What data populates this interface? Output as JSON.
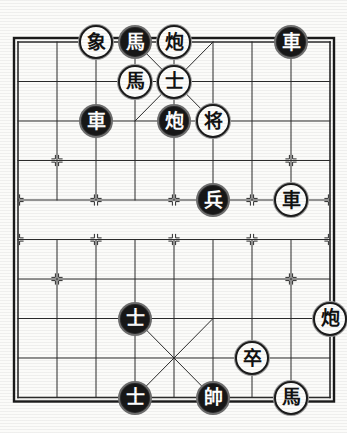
{
  "app": {
    "title": "Xiangqi Board Position",
    "kind": "chinese-chess-board"
  },
  "board": {
    "files": 9,
    "ranks": 10,
    "origin_x": 18,
    "origin_y": 42,
    "file_step": 39,
    "rank_step": 39.5,
    "river_extra": 0,
    "line_color": "#2b2b2b",
    "border_color": "#1a1a1a",
    "background_color": "#fbfbf9",
    "palace_top_ranks": [
      0,
      2
    ],
    "palace_bottom_ranks": [
      7,
      9
    ],
    "palace_files": [
      3,
      5
    ],
    "river_top_rank": 4,
    "river_bottom_rank": 5,
    "star_points": [
      {
        "file": 1,
        "rank": 3
      },
      {
        "file": 7,
        "rank": 3
      },
      {
        "file": 1,
        "rank": 6
      },
      {
        "file": 7,
        "rank": 6
      },
      {
        "file": 0,
        "rank": 4
      },
      {
        "file": 2,
        "rank": 4
      },
      {
        "file": 4,
        "rank": 4
      },
      {
        "file": 6,
        "rank": 4
      },
      {
        "file": 8,
        "rank": 4
      },
      {
        "file": 0,
        "rank": 5
      },
      {
        "file": 2,
        "rank": 5
      },
      {
        "file": 4,
        "rank": 5
      },
      {
        "file": 6,
        "rank": 5
      },
      {
        "file": 8,
        "rank": 5
      }
    ]
  },
  "pieces": [
    {
      "id": "p1",
      "glyph": "象",
      "name": "elephant",
      "style": "light",
      "file": 2,
      "rank": 0
    },
    {
      "id": "p2",
      "glyph": "馬",
      "name": "horse",
      "style": "dark",
      "file": 3,
      "rank": 0
    },
    {
      "id": "p3",
      "glyph": "炮",
      "name": "cannon",
      "style": "light",
      "file": 4,
      "rank": 0
    },
    {
      "id": "p4",
      "glyph": "車",
      "name": "chariot",
      "style": "dark",
      "file": 7,
      "rank": 0
    },
    {
      "id": "p5",
      "glyph": "馬",
      "name": "horse",
      "style": "light",
      "file": 3,
      "rank": 1
    },
    {
      "id": "p6",
      "glyph": "士",
      "name": "advisor",
      "style": "light",
      "file": 4,
      "rank": 1
    },
    {
      "id": "p7",
      "glyph": "車",
      "name": "chariot",
      "style": "dark",
      "file": 2,
      "rank": 2
    },
    {
      "id": "p8",
      "glyph": "炮",
      "name": "cannon",
      "style": "dark",
      "file": 4,
      "rank": 2
    },
    {
      "id": "p9",
      "glyph": "将",
      "name": "general",
      "style": "light",
      "file": 5,
      "rank": 2
    },
    {
      "id": "p10",
      "glyph": "兵",
      "name": "soldier",
      "style": "dark",
      "file": 5,
      "rank": 4
    },
    {
      "id": "p11",
      "glyph": "車",
      "name": "chariot",
      "style": "light",
      "file": 7,
      "rank": 4
    },
    {
      "id": "p12",
      "glyph": "士",
      "name": "advisor",
      "style": "dark",
      "file": 3,
      "rank": 7
    },
    {
      "id": "p13",
      "glyph": "炮",
      "name": "cannon",
      "style": "light",
      "file": 8,
      "rank": 7
    },
    {
      "id": "p14",
      "glyph": "卒",
      "name": "pawn",
      "style": "light",
      "file": 6,
      "rank": 8
    },
    {
      "id": "p15",
      "glyph": "士",
      "name": "advisor",
      "style": "dark",
      "file": 3,
      "rank": 9
    },
    {
      "id": "p16",
      "glyph": "帥",
      "name": "marshal",
      "style": "dark",
      "file": 5,
      "rank": 9
    },
    {
      "id": "p17",
      "glyph": "馬",
      "name": "horse",
      "style": "light",
      "file": 7,
      "rank": 9
    }
  ]
}
